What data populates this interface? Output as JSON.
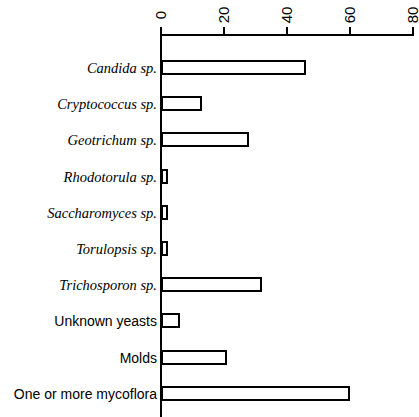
{
  "chart_data": {
    "type": "bar",
    "orientation": "horizontal",
    "title": "",
    "xlabel": "",
    "ylabel": "",
    "xlim": [
      0,
      80
    ],
    "xticks": [
      0,
      20,
      40,
      60,
      80
    ],
    "xtick_labels": [
      "0",
      "20",
      "40",
      "60",
      "80"
    ],
    "grid": false,
    "legend": null,
    "axis_position": "top",
    "bar_style": "open-outline",
    "categories": [
      "Candida sp.",
      "Cryptococcus sp.",
      "Geotrichum sp.",
      "Rhodotorula sp.",
      "Saccharomyces sp.",
      "Torulopsis sp.",
      "Trichosporon sp.",
      "Unknown yeasts",
      "Molds",
      "One or more mycoflora"
    ],
    "values": [
      46,
      13,
      28,
      2,
      2,
      2,
      32,
      6,
      21,
      60
    ],
    "category_styles": [
      "italic",
      "italic",
      "italic",
      "italic",
      "italic",
      "italic",
      "italic",
      "upright",
      "upright",
      "upright"
    ]
  }
}
